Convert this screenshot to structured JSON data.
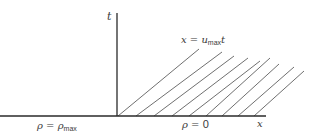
{
  "diagram": {
    "type": "characteristics",
    "axes": {
      "vertical_label": "t",
      "horizontal_label": "x"
    },
    "characteristic_label": {
      "lhs": "x",
      "eq": "=",
      "var": "u",
      "sub": "max",
      "rhs_var": "t"
    },
    "regions": {
      "left": {
        "symbol": "ρ",
        "eq": "=",
        "value_symbol": "ρ",
        "value_sub": "max"
      },
      "right": {
        "symbol": "ρ",
        "eq": "=",
        "value": "0"
      }
    },
    "colors": {
      "axis": "#2a2a2a",
      "characteristic_lines": "#4a4a4a",
      "text": "#3a3a3a",
      "background": "#ffffff"
    },
    "characteristic_line_count": 9
  }
}
